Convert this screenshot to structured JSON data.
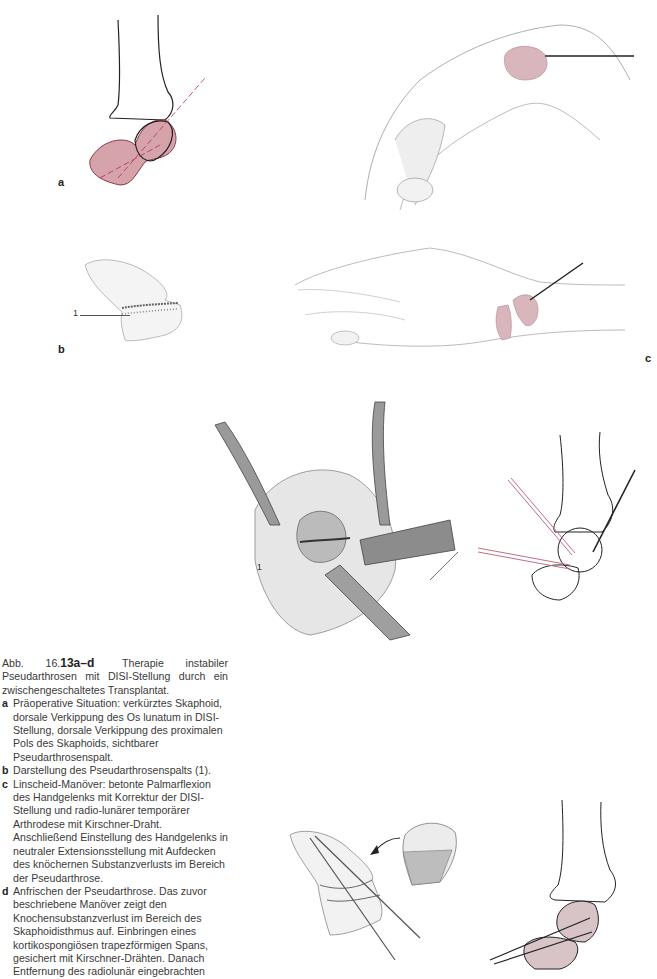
{
  "figure": {
    "number_prefix": "Abb. 16.",
    "number_bold": "13a–d",
    "title": "Therapie instabiler Pseudarthrosen mit DISI-Stellung durch ein zwischengeschaltetes Transplantat.",
    "items": [
      {
        "letter": "a",
        "text": "Präoperative Situation: verkürztes Skaphoid, dorsale Verkippung des Os lunatum in DISI-Stellung, dorsale Verkippung des proximalen Pols des Skaphoids, sichtbarer Pseudarthrosenspalt."
      },
      {
        "letter": "b",
        "text": "Darstellung des Pseudarthrosenspalts (1)."
      },
      {
        "letter": "c",
        "text": "Linscheid-Manöver: betonte Palmarflexion des Handgelenks mit Korrektur der DISI-Stellung und radio-lunärer temporärer Arthrodese mit Kirschner-Draht. Anschließend Einstellung des Handgelenks in neutraler Extensionsstellung mit Aufdecken des knöchernen Substanzverlusts im Bereich der Pseudarthrose."
      },
      {
        "letter": "d",
        "text": "Anfrischen der Pseudarthrose. Das zuvor beschriebene Manöver zeigt den Knochensubstanzverlust im Bereich des Skaphoidisthmus auf. Einbringen eines kortikospongiösen trapezförmigen Spans, gesichert mit Kirschner-Drähten. Danach Entfernung des radiolunär eingebrachten"
      }
    ]
  },
  "panels": {
    "a": {
      "label": "a"
    },
    "b": {
      "label": "b",
      "callout": "1"
    },
    "c": {
      "label": "c"
    },
    "d": {
      "callout": "1"
    }
  },
  "colors": {
    "bone_pink": "#c9848f",
    "bone_pink_light": "#d8b6bb",
    "wire_red": "#c07080",
    "line_dark": "#222222"
  }
}
